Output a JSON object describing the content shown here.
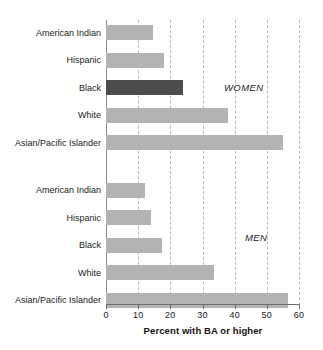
{
  "chart_data": {
    "type": "bar",
    "orientation": "horizontal",
    "title": "",
    "xlabel": "Percent with BA or higher",
    "ylabel": "",
    "xlim": [
      0,
      60
    ],
    "xticks": [
      0,
      10,
      20,
      30,
      40,
      50,
      60
    ],
    "xtick_labels": [
      "0",
      "10",
      "20",
      "30",
      "40",
      "50",
      "60"
    ],
    "grid": true,
    "grid_style": "dashed vertical",
    "legend": "none",
    "annotations": [
      {
        "text": "WOMEN",
        "group": "women"
      },
      {
        "text": "MEN",
        "group": "men"
      }
    ],
    "groups": [
      {
        "name": "WOMEN",
        "categories": [
          "American Indian",
          "Hispanic",
          "Black",
          "White",
          "Asian/Pacific Islander"
        ],
        "values": [
          14.5,
          18,
          24,
          38,
          55
        ],
        "highlight_index": 2
      },
      {
        "name": "MEN",
        "categories": [
          "American Indian",
          "Hispanic",
          "Black",
          "White",
          "Asian/Pacific Islander"
        ],
        "values": [
          12,
          14,
          17.5,
          33.5,
          56.5
        ],
        "highlight_index": null
      }
    ],
    "colors": {
      "bar": "#b3b3b3",
      "bar_highlight": "#4d4d4d",
      "grid": "#b9b9b9",
      "axis": "#6f6f6f",
      "text": "#1a1a1a",
      "background": "#ffffff"
    }
  },
  "rows": [
    {
      "label": "American Indian",
      "value": 14.5,
      "group": "women",
      "highlight": false
    },
    {
      "label": "Hispanic",
      "value": 18,
      "group": "women",
      "highlight": false
    },
    {
      "label": "Black",
      "value": 24,
      "group": "women",
      "highlight": true
    },
    {
      "label": "White",
      "value": 38,
      "group": "women",
      "highlight": false
    },
    {
      "label": "Asian/Pacific Islander",
      "value": 55,
      "group": "women",
      "highlight": false
    },
    {
      "label": "American Indian",
      "value": 12,
      "group": "men",
      "highlight": false
    },
    {
      "label": "Hispanic",
      "value": 14,
      "group": "men",
      "highlight": false
    },
    {
      "label": "Black",
      "value": 17.5,
      "group": "men",
      "highlight": false
    },
    {
      "label": "White",
      "value": 33.5,
      "group": "men",
      "highlight": false
    },
    {
      "label": "Asian/Pacific Islander",
      "value": 56.5,
      "group": "men",
      "highlight": false
    }
  ],
  "annotations": {
    "women": "WOMEN",
    "men": "MEN"
  },
  "axis": {
    "title": "Percent with BA or higher",
    "ticks": [
      "0",
      "10",
      "20",
      "30",
      "40",
      "50",
      "60"
    ]
  }
}
